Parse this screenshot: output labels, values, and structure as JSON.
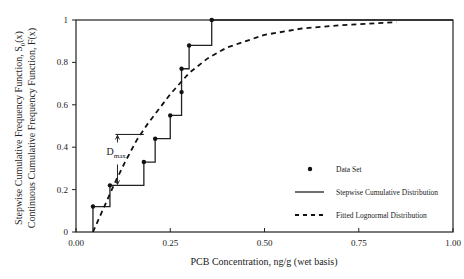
{
  "chart_data": {
    "type": "line",
    "title": "",
    "xlabel": "PCB Concentration, ng/g (wet basis)",
    "ylabel_lines": [
      "Stepwise Cumulative Frequency Function, S",
      "Continuous Cumulative Frequency Function, F(x)"
    ],
    "ylabel_sub": "0",
    "ylabel_suffix": "(x)",
    "xlim": [
      0,
      1.0
    ],
    "ylim": [
      0,
      1.0
    ],
    "x_ticks": [
      0,
      0.25,
      0.5,
      0.75,
      1.0
    ],
    "x_tick_labels": [
      "0.00",
      "0.25",
      "0.50",
      "0.75",
      "1.00"
    ],
    "y_ticks": [
      0,
      0.2,
      0.4,
      0.6,
      0.8,
      1.0
    ],
    "y_tick_labels": [
      "0",
      "0.2",
      "0.4",
      "0.6",
      "0.8",
      "1"
    ],
    "grid": false,
    "series": [
      {
        "name": "Data Set",
        "kind": "points",
        "x": [
          0.045,
          0.09,
          0.18,
          0.21,
          0.25,
          0.28,
          0.28,
          0.3,
          0.36
        ],
        "y": [
          0.12,
          0.22,
          0.33,
          0.44,
          0.55,
          0.66,
          0.77,
          0.88,
          1.0
        ]
      },
      {
        "name": "Stepwise Cumulative Distribution",
        "kind": "step",
        "x": [
          0.045,
          0.09,
          0.18,
          0.21,
          0.25,
          0.28,
          0.28,
          0.3,
          0.36
        ],
        "y": [
          0.12,
          0.22,
          0.33,
          0.44,
          0.55,
          0.66,
          0.77,
          0.88,
          1.0
        ]
      },
      {
        "name": "Fitted Lognormal Distribution",
        "kind": "dashed",
        "x": [
          0.045,
          0.07,
          0.1,
          0.13,
          0.16,
          0.19,
          0.22,
          0.25,
          0.3,
          0.35,
          0.4,
          0.5,
          0.6,
          0.7,
          0.85
        ],
        "y": [
          0.0,
          0.1,
          0.22,
          0.33,
          0.43,
          0.51,
          0.58,
          0.65,
          0.75,
          0.82,
          0.87,
          0.93,
          0.96,
          0.975,
          0.99
        ]
      }
    ],
    "annotations": [
      {
        "text": "D",
        "sub": "max",
        "x_from": 0.11,
        "y_from": 0.46,
        "y_to": 0.22,
        "bracket_x_to": 0.18
      }
    ],
    "legend": {
      "placement": "bottom-right",
      "entries": [
        "Data Set",
        "Stepwise Cumulative Distribution",
        "Fitted Lognormal Distribution"
      ]
    }
  }
}
